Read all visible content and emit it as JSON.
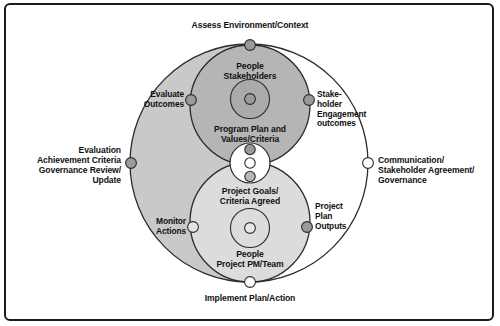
{
  "diagram": {
    "type": "concentric-circles-venn",
    "colors": {
      "stroke": "#2b2b2b",
      "outer_left_fill": "#c9c9c9",
      "outer_right_fill": "#ffffff",
      "top_lobe_fill": "#b5b5b5",
      "bottom_lobe_fill": "#dcdcdc",
      "node_filled": "#9a9a9a",
      "node_empty": "#ffffff",
      "text": "#111111",
      "border": "#1a1a1a",
      "background": "#ffffff"
    },
    "outer_labels": [
      {
        "id": "assess",
        "name": "assess-environment-label",
        "text": "Assess Environment/Context",
        "align": "center"
      },
      {
        "id": "communication",
        "name": "communication-governance-label",
        "text": "Communication/\nStakeholder Agreement/\nGovernance",
        "align": "left"
      },
      {
        "id": "implement",
        "name": "implement-plan-label",
        "text": "Implement Plan/Action",
        "align": "center"
      },
      {
        "id": "evaluation",
        "name": "evaluation-governance-label",
        "text": "Evaluation\nAchievement Criteria\nGovernance Review/\nUpdate",
        "align": "right"
      }
    ],
    "ring_labels": [
      {
        "id": "evaluate_outcomes",
        "name": "evaluate-outcomes-label",
        "text": "Evaluate\nOutcomes",
        "align": "right"
      },
      {
        "id": "stakeholder_engagement",
        "name": "stakeholder-engagement-label",
        "text": "Stake-\nholder\nEngagement\noutcomes",
        "align": "left"
      },
      {
        "id": "monitor_actions",
        "name": "monitor-actions-label",
        "text": "Monitor\nActions",
        "align": "right"
      },
      {
        "id": "project_plan_outputs",
        "name": "project-plan-outputs-label",
        "text": "Project\nPlan\nOutputs",
        "align": "left"
      }
    ],
    "core_labels": [
      {
        "id": "people_stakeholders",
        "name": "people-stakeholders-label",
        "text": "People\nStakeholders",
        "align": "center"
      },
      {
        "id": "program_plan",
        "name": "program-plan-values-label",
        "text": "Program Plan and\nValues/Criteria",
        "align": "center"
      },
      {
        "id": "project_goals",
        "name": "project-goals-criteria-label",
        "text": "Project Goals/\nCriteria Agreed",
        "align": "center"
      },
      {
        "id": "people_project",
        "name": "people-project-team-label",
        "text": "People\nProject PM/Team",
        "align": "center"
      }
    ],
    "nodes": [
      {
        "id": "node_top_outer",
        "name": "node-assess-environment",
        "filled": true
      },
      {
        "id": "node_left_outer",
        "name": "node-evaluation-governance",
        "filled": true
      },
      {
        "id": "node_right_outer",
        "name": "node-communication",
        "filled": false
      },
      {
        "id": "node_bottom_outer",
        "name": "node-implement-plan",
        "filled": false
      },
      {
        "id": "node_top_left",
        "name": "node-evaluate-outcomes",
        "filled": true
      },
      {
        "id": "node_top_right",
        "name": "node-stakeholder-engagement",
        "filled": true
      },
      {
        "id": "node_bottom_left",
        "name": "node-monitor-actions",
        "filled": false
      },
      {
        "id": "node_bottom_right",
        "name": "node-project-plan-outputs",
        "filled": true
      },
      {
        "id": "node_core_top",
        "name": "node-core-top",
        "filled": true
      },
      {
        "id": "node_core_mid",
        "name": "node-core-middle",
        "filled": false
      },
      {
        "id": "node_core_low",
        "name": "node-core-lower",
        "filled": true
      },
      {
        "id": "node_hub_top",
        "name": "node-hub-stakeholders",
        "filled": true
      },
      {
        "id": "node_hub_bottom",
        "name": "node-hub-project-team",
        "filled": false
      }
    ]
  }
}
